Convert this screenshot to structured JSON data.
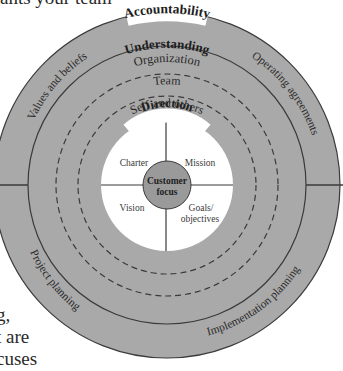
{
  "context_text": {
    "top": "ants your team",
    "bottom_lines": [
      "g,",
      "t are",
      "cuses"
    ]
  },
  "diagram": {
    "colors": {
      "ring_fill": "#a9a9a9",
      "inner_fill": "#ffffff",
      "core_fill": "#9a9a9a",
      "stroke": "#3a3a3a",
      "text": "#2a2a2a"
    },
    "outer_ring": {
      "title": "Accountability",
      "quadrants": [
        "Values and beliefs",
        "Operating agreements",
        "Project planning",
        "Implementation planning"
      ]
    },
    "understanding": {
      "title": "Understanding",
      "levels": [
        "Organization",
        "Team",
        "Self and others"
      ]
    },
    "direction": {
      "title": "Direction",
      "quadrants": {
        "top_left": "Charter",
        "top_right": "Mission",
        "bottom_left": "Vision",
        "bottom_right_line1": "Goals/",
        "bottom_right_line2": "objectives"
      }
    },
    "core": {
      "line1": "Customer",
      "line2": "focus"
    }
  }
}
